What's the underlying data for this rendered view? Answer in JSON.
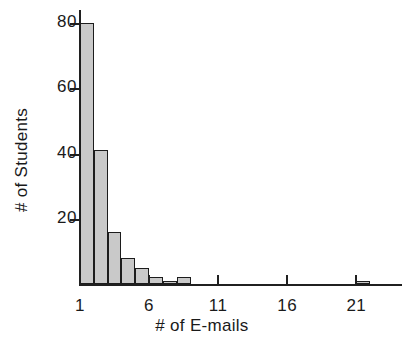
{
  "chart_data": {
    "type": "bar",
    "title": "",
    "xlabel": "# of E-mails",
    "ylabel": "# of Students",
    "xlim": [
      1,
      23
    ],
    "ylim": [
      0,
      84
    ],
    "grid": false,
    "legend": null,
    "x_ticks": [
      1,
      6,
      11,
      16,
      21
    ],
    "x_tick_labels": [
      "1",
      "6",
      "11",
      "16",
      "21"
    ],
    "y_ticks": [
      20,
      40,
      60,
      80
    ],
    "y_tick_labels": [
      "20",
      "40",
      "60",
      "80"
    ],
    "bin_width": 1,
    "bin_starts": [
      1,
      2,
      3,
      4,
      5,
      6,
      7,
      8,
      21
    ],
    "categories": [
      "1",
      "2",
      "3",
      "4",
      "5",
      "6",
      "7",
      "8",
      "21"
    ],
    "values": [
      80,
      41,
      16,
      8,
      5,
      2,
      1,
      2,
      1
    ],
    "bar_fill_color": "#c9c9c9",
    "bar_edge_color": "#1c1c1c",
    "axis_color": "#202020",
    "background_color": "#ffffff"
  }
}
